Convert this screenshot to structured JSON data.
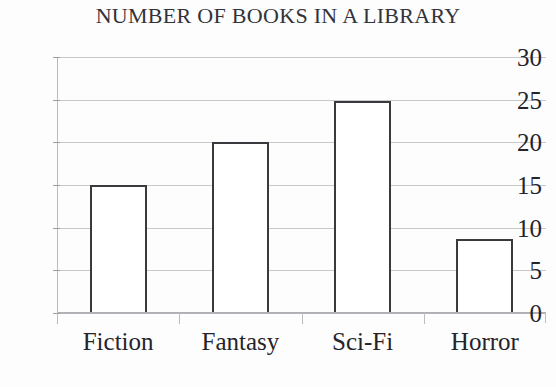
{
  "chart_data": {
    "type": "bar",
    "title": "NUMBER OF BOOKS IN A LIBRARY",
    "xlabel": "",
    "ylabel": "",
    "categories": [
      "Fiction",
      "Fantasy",
      "Sci-Fi",
      "Horror"
    ],
    "values": [
      15,
      20,
      24.8,
      8.7
    ],
    "ylim": [
      0,
      30
    ],
    "yticks": [
      0,
      5,
      10,
      15,
      20,
      25,
      30
    ],
    "ytick_labels": [
      "0",
      "5",
      "10",
      "15",
      "20",
      "25",
      "30"
    ],
    "grid": true,
    "legend": null,
    "series": [
      {
        "name": "Number of books",
        "values": [
          15,
          20,
          24.8,
          8.7
        ]
      }
    ],
    "colors": {
      "bar_fill": "#ffffff",
      "bar_outline": "#3a3a3e",
      "gridline": "#c9c9cc",
      "axis": "#b0b0b4",
      "text": "#24242a",
      "background": "#fdfdfd"
    }
  }
}
